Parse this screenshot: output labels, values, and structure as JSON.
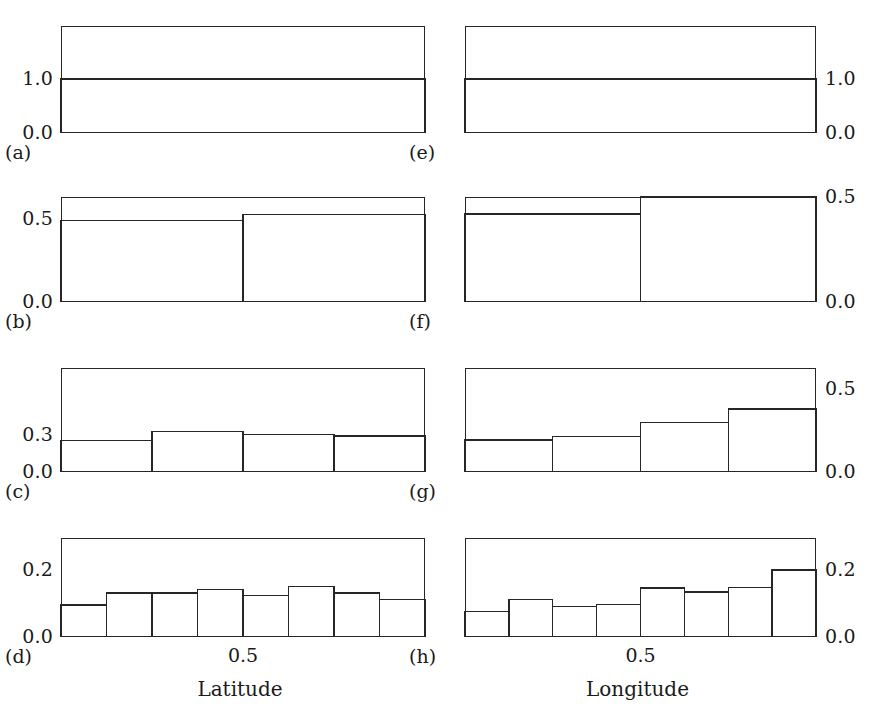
{
  "figure": {
    "background": "#ffffff",
    "ink_color": "#262626",
    "columns": 2,
    "rows": 4
  },
  "chart_data": [
    {
      "id": "a",
      "type": "bar",
      "panel_tag": "(a)",
      "title": "",
      "xlabel": "",
      "ylabel": "",
      "label_side": "left",
      "categories": [
        "[0, 1]"
      ],
      "bin_edges": [
        0,
        1
      ],
      "values": [
        1.0
      ],
      "ytick_values": [
        0.0,
        1.0
      ],
      "ytick_labels": [
        "0.0",
        "1.0"
      ],
      "ylim": [
        0,
        1.98
      ],
      "xlim": [
        0,
        1
      ],
      "xtick_labels": [],
      "grid": false
    },
    {
      "id": "b",
      "type": "bar",
      "panel_tag": "(b)",
      "title": "",
      "xlabel": "",
      "ylabel": "",
      "label_side": "left",
      "categories": [
        "[0, 0.5]",
        "[0.5, 1]"
      ],
      "bin_edges": [
        0,
        0.5,
        1
      ],
      "values": [
        0.49,
        0.525
      ],
      "ytick_values": [
        0.0,
        0.5
      ],
      "ytick_labels": [
        "0.0",
        "0.5"
      ],
      "ylim": [
        0,
        0.632
      ],
      "xlim": [
        0,
        1
      ],
      "xtick_labels": [],
      "grid": false
    },
    {
      "id": "c",
      "type": "bar",
      "panel_tag": "(c)",
      "title": "",
      "xlabel": "",
      "ylabel": "",
      "label_side": "left",
      "categories": [
        "[0, 0.25]",
        "[0.25, 0.5]",
        "[0.5, 0.75]",
        "[0.75, 1]"
      ],
      "bin_edges": [
        0,
        0.25,
        0.5,
        0.75,
        1
      ],
      "values": [
        0.255,
        0.33,
        0.305,
        0.293
      ],
      "ytick_values": [
        0.0,
        0.3
      ],
      "ytick_labels": [
        "0.0",
        "0.3"
      ],
      "ylim": [
        0,
        0.843
      ],
      "xlim": [
        0,
        1
      ],
      "xtick_labels": [],
      "grid": false
    },
    {
      "id": "d",
      "type": "bar",
      "panel_tag": "(d)",
      "title": "",
      "xlabel": "Latitude",
      "ylabel": "",
      "label_side": "left",
      "categories": [
        "[0, .125]",
        "[.125, .25]",
        "[.25, .375]",
        "[.375, .5]",
        "[.5, .625]",
        "[.625, .75]",
        "[.75, .875]",
        "[.875, 1]"
      ],
      "bin_edges": [
        0,
        0.125,
        0.25,
        0.375,
        0.5,
        0.625,
        0.75,
        0.875,
        1
      ],
      "values": [
        0.095,
        0.131,
        0.131,
        0.142,
        0.124,
        0.151,
        0.131,
        0.112
      ],
      "ytick_values": [
        0.0,
        0.2
      ],
      "ytick_labels": [
        "0.0",
        "0.2"
      ],
      "ylim": [
        0,
        0.295
      ],
      "xlim": [
        0,
        1
      ],
      "xtick_values": [
        0.5
      ],
      "xtick_labels": [
        "0.5"
      ],
      "grid": false
    },
    {
      "id": "e",
      "type": "bar",
      "panel_tag": "(e)",
      "title": "",
      "xlabel": "",
      "ylabel": "",
      "label_side": "right",
      "categories": [
        "[0, 1]"
      ],
      "bin_edges": [
        0,
        1
      ],
      "values": [
        1.0
      ],
      "ytick_values": [
        0.0,
        1.0
      ],
      "ytick_labels": [
        "0.0",
        "1.0"
      ],
      "ylim": [
        0,
        1.98
      ],
      "xlim": [
        0,
        1
      ],
      "xtick_labels": [],
      "grid": false
    },
    {
      "id": "f",
      "type": "bar",
      "panel_tag": "(f)",
      "title": "",
      "xlabel": "",
      "ylabel": "",
      "label_side": "right",
      "categories": [
        "[0, 0.5]",
        "[0.5, 1]"
      ],
      "bin_edges": [
        0,
        0.5,
        1
      ],
      "values": [
        0.42,
        0.5
      ],
      "ytick_values": [
        0.0,
        0.5
      ],
      "ytick_labels": [
        "0.0",
        "0.5"
      ],
      "ylim": [
        0,
        0.5
      ],
      "xlim": [
        0,
        1
      ],
      "xtick_labels": [],
      "grid": false
    },
    {
      "id": "g",
      "type": "bar",
      "panel_tag": "(g)",
      "title": "",
      "xlabel": "",
      "ylabel": "",
      "label_side": "right",
      "categories": [
        "[0, 0.25]",
        "[0.25, 0.5]",
        "[0.5, 0.75]",
        "[0.75, 1]"
      ],
      "bin_edges": [
        0,
        0.25,
        0.5,
        0.75,
        1
      ],
      "values": [
        0.193,
        0.216,
        0.301,
        0.381
      ],
      "ytick_values": [
        0.0,
        0.5
      ],
      "ytick_labels": [
        "0.0",
        "0.5"
      ],
      "ylim": [
        0,
        0.63
      ],
      "xlim": [
        0,
        1
      ],
      "xtick_labels": [],
      "grid": false
    },
    {
      "id": "h",
      "type": "bar",
      "panel_tag": "(h)",
      "title": "",
      "xlabel": "Longitude",
      "ylabel": "",
      "label_side": "right",
      "categories": [
        "[0, .125]",
        "[.125, .25]",
        "[.25, .375]",
        "[.375, .5]",
        "[.5, .625]",
        "[.625, .75]",
        "[.75, .875]",
        "[.875, 1]"
      ],
      "bin_edges": [
        0,
        0.125,
        0.25,
        0.375,
        0.5,
        0.625,
        0.75,
        0.875,
        1
      ],
      "values": [
        0.076,
        0.111,
        0.091,
        0.097,
        0.146,
        0.134,
        0.148,
        0.2
      ],
      "ytick_values": [
        0.0,
        0.2
      ],
      "ytick_labels": [
        "0.0",
        "0.2"
      ],
      "ylim": [
        0,
        0.295
      ],
      "xlim": [
        0,
        1
      ],
      "xtick_values": [
        0.5
      ],
      "xtick_labels": [
        "0.5"
      ],
      "grid": false
    }
  ],
  "layout": {
    "panel_geometry": [
      {
        "id": "a",
        "x": 61,
        "y": 26,
        "w": 364,
        "h": 107
      },
      {
        "id": "b",
        "x": 61,
        "y": 197,
        "w": 364,
        "h": 105
      },
      {
        "id": "c",
        "x": 61,
        "y": 368,
        "w": 364,
        "h": 104
      },
      {
        "id": "d",
        "x": 61,
        "y": 538,
        "w": 364,
        "h": 99
      },
      {
        "id": "e",
        "x": 465,
        "y": 26,
        "w": 351,
        "h": 107
      },
      {
        "id": "f",
        "x": 465,
        "y": 197,
        "w": 351,
        "h": 105
      },
      {
        "id": "g",
        "x": 465,
        "y": 368,
        "w": 351,
        "h": 104
      },
      {
        "id": "h",
        "x": 465,
        "y": 538,
        "w": 351,
        "h": 99
      }
    ]
  }
}
